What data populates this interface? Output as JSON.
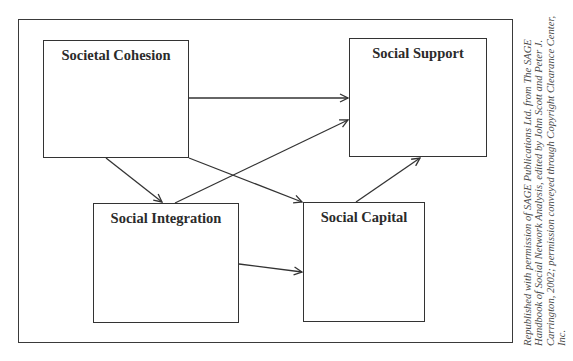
{
  "diagram": {
    "nodes": [
      {
        "id": "societal-cohesion",
        "label": "Societal Cohesion",
        "x": 43,
        "y": 40,
        "w": 146,
        "h": 118
      },
      {
        "id": "social-support",
        "label": "Social Support",
        "x": 349,
        "y": 38,
        "w": 138,
        "h": 119
      },
      {
        "id": "social-integration",
        "label": "Social Integration",
        "x": 93,
        "y": 203,
        "w": 146,
        "h": 120
      },
      {
        "id": "social-capital",
        "label": "Social Capital",
        "x": 303,
        "y": 202,
        "w": 122,
        "h": 120
      }
    ],
    "edges": [
      {
        "from": "societal-cohesion",
        "to": "social-support",
        "x1": 189,
        "y1": 98,
        "x2": 348,
        "y2": 98
      },
      {
        "from": "societal-cohesion",
        "to": "social-integration",
        "x1": 106,
        "y1": 158,
        "x2": 162,
        "y2": 202
      },
      {
        "from": "societal-cohesion",
        "to": "social-capital",
        "x1": 189,
        "y1": 158,
        "x2": 302,
        "y2": 202
      },
      {
        "from": "social-integration",
        "to": "social-support",
        "x1": 175,
        "y1": 203,
        "x2": 348,
        "y2": 120
      },
      {
        "from": "social-integration",
        "to": "social-capital",
        "x1": 239,
        "y1": 264,
        "x2": 302,
        "y2": 272
      },
      {
        "from": "social-capital",
        "to": "social-support",
        "x1": 356,
        "y1": 202,
        "x2": 420,
        "y2": 158
      }
    ],
    "stroke_color": "#333333"
  },
  "caption": {
    "text": "Republished with permission of SAGE Publications Ltd. from The SAGE Handbook of Social Network Analysis, edited by John Scott and Peter J. Carrington, 2002; permission conveyed through Copyright Clearance Center, Inc."
  }
}
